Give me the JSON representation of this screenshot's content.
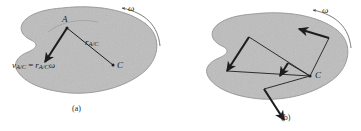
{
  "figure": {
    "type": "technical-illustration",
    "background_color": "#ffffff",
    "body_fill_color": "#bdbdbd",
    "body_stroke_color": "#8a8a8a",
    "vector_color": "#1d1d1d",
    "panels": [
      {
        "id": "a",
        "caption": "(a)",
        "points": [
          {
            "name": "A",
            "label": "A"
          },
          {
            "name": "C",
            "label": "C"
          }
        ],
        "labels": {
          "position_vector": "r",
          "position_vector_sub": "A/C",
          "velocity_lhs": "v",
          "velocity_lhs_sub": "A/C",
          "velocity_eq": "=",
          "velocity_rhs": "r",
          "velocity_rhs_sub": "A/C",
          "omega": "ω"
        },
        "angular_velocity_symbol": "ω"
      },
      {
        "id": "b",
        "caption": "(b)",
        "points": [
          {
            "name": "C",
            "label": "C"
          }
        ],
        "labels": {
          "omega": "ω"
        },
        "angular_velocity_symbol": "ω",
        "velocity_vector_count": 4
      }
    ]
  }
}
